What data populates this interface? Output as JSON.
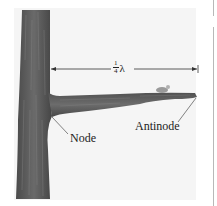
{
  "figure": {
    "dimension_label": {
      "numerator": "1",
      "denominator": "4",
      "symbol": "λ"
    },
    "labels": {
      "node": "Node",
      "antinode": "Antinode"
    },
    "colors": {
      "background": "#f4f4f4",
      "bark": "#5a5a5a",
      "bark_dark": "#3c3c3c",
      "line": "#333333"
    }
  }
}
